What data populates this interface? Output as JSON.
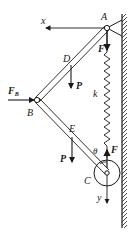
{
  "figure": {
    "labels": {
      "A": "A",
      "B": "B",
      "C": "C",
      "D": "D",
      "E": "E",
      "x_axis": "x",
      "y_axis": "y",
      "spring": "k",
      "angle": "θ",
      "force_B": "F",
      "force_B_sub": "B",
      "force_spring_top": "F",
      "force_spring_bottom": "F",
      "weight_D": "P",
      "weight_E": "P"
    },
    "colors": {
      "stroke": "#1a1a1a",
      "background": "#ffffff"
    }
  }
}
